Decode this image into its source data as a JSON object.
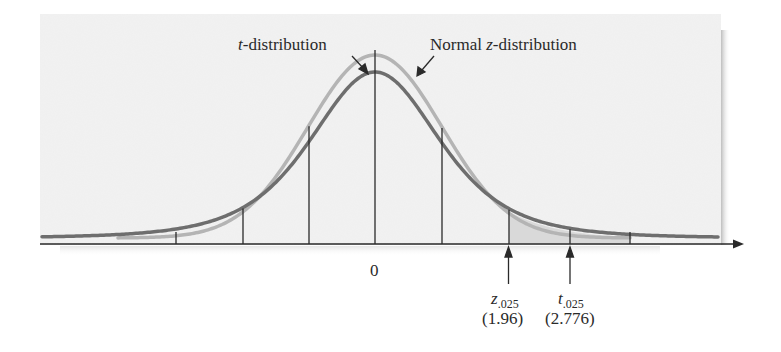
{
  "figure": {
    "title": "",
    "labels": {
      "t_curve": {
        "italic": "t",
        "rest": "-distribution"
      },
      "z_curve": {
        "prefix": "Normal ",
        "italic": "z",
        "rest": "-distribution"
      },
      "center_tick": "0",
      "z_crit": {
        "symbol": "z",
        "subscript": ".025",
        "value": "(1.96)"
      },
      "t_crit": {
        "symbol": "t",
        "subscript": ".025",
        "value": "(2.776)"
      }
    },
    "colors": {
      "panel": "#efefef",
      "panel_shadow": "#c8c8c8",
      "t_curve": "#6e6e6e",
      "z_curve": "#b4b4b4",
      "shade": "#d9d9d9",
      "axis": "#2a2a2a"
    }
  },
  "chart_data": {
    "type": "line",
    "title": "",
    "xlabel": "",
    "ylabel": "",
    "series": [
      {
        "name": "Normal z-distribution",
        "distribution": "standard normal",
        "peak_relative": 1.0
      },
      {
        "name": "t-distribution",
        "distribution": "Student t, df=4",
        "peak_relative": 0.92
      }
    ],
    "x_ticks": [
      -3,
      -2,
      -1,
      0,
      1,
      1.96,
      2.776,
      3.8
    ],
    "x_tick_labels_shown": {
      "0": "0"
    },
    "critical_values": [
      {
        "label": "z.025",
        "value": 1.96
      },
      {
        "label": "t.025",
        "value": 2.776
      }
    ],
    "shaded_region": {
      "from": 1.96,
      "to": 3.8,
      "meaning": "upper tail area between z.025 and beyond t.025"
    },
    "annotations": [
      "t-distribution",
      "Normal z-distribution"
    ],
    "grid": false,
    "legend": "none (arrow annotations)"
  }
}
